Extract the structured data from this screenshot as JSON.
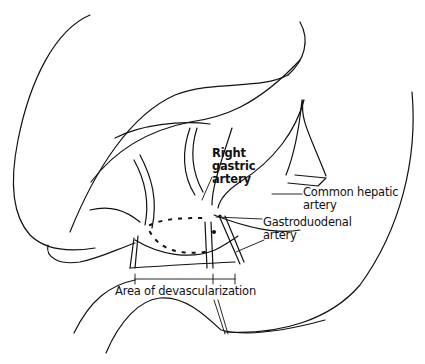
{
  "diagram": {
    "type": "anatomical line drawing",
    "labels": {
      "right_gastric": [
        "Right",
        "gastric",
        "artery"
      ],
      "common_hepatic": [
        "Common hepatic",
        "artery"
      ],
      "gastroduodenal": [
        "Gastroduodenal",
        "artery"
      ],
      "area": "Area of devascularization"
    },
    "colors": {
      "line": "#111111",
      "background": "#ffffff"
    }
  }
}
